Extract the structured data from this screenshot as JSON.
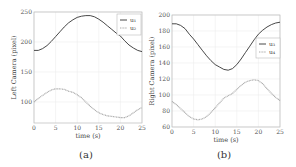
{
  "chart_data": [
    {
      "type": "line",
      "panel_label": "(a)",
      "title": "",
      "xlabel": "time (s)",
      "ylabel": "Left Camera (pixel)",
      "xlim": [
        0,
        25
      ],
      "ylim": [
        65,
        250
      ],
      "xticks": [
        0,
        5,
        10,
        15,
        20,
        25
      ],
      "yticks": [
        100,
        150,
        200,
        250
      ],
      "grid": true,
      "legend_position": "upper right",
      "x": [
        0,
        1,
        2,
        3,
        4,
        5,
        6,
        7,
        8,
        9,
        10,
        11,
        12,
        13,
        14,
        15,
        16,
        17,
        18,
        19,
        20,
        21,
        22,
        23,
        24,
        25
      ],
      "series": [
        {
          "name": "u1",
          "style": "solid",
          "color": "#333333",
          "values": [
            186,
            186,
            189,
            194,
            201,
            209,
            217,
            225,
            232,
            237,
            241,
            243,
            244,
            244,
            242,
            238,
            233,
            227,
            221,
            215,
            210,
            202,
            195,
            190,
            186,
            184
          ]
        },
        {
          "name": "u2",
          "style": "dotted",
          "color": "#aaaaaa",
          "values": [
            100,
            106,
            111,
            116,
            120,
            122,
            122,
            121,
            118,
            116,
            112,
            107,
            100,
            93,
            87,
            82,
            79,
            77,
            76,
            75,
            74,
            74,
            77,
            82,
            87,
            91
          ]
        }
      ]
    },
    {
      "type": "line",
      "panel_label": "(b)",
      "title": "",
      "xlabel": "time (s)",
      "ylabel": "Right Camera (pixel)",
      "xlim": [
        0,
        25
      ],
      "ylim": [
        60,
        200
      ],
      "xticks": [
        0,
        5,
        10,
        15,
        20,
        25
      ],
      "yticks": [
        60,
        80,
        100,
        120,
        140,
        160,
        180,
        200
      ],
      "grid": true,
      "legend_position": "center right",
      "x": [
        0,
        1,
        2,
        3,
        4,
        5,
        6,
        7,
        8,
        9,
        10,
        11,
        12,
        13,
        14,
        15,
        16,
        17,
        18,
        19,
        20,
        21,
        22,
        23,
        24,
        25
      ],
      "series": [
        {
          "name": "u3",
          "style": "solid",
          "color": "#333333",
          "values": [
            189,
            189,
            187,
            183,
            176,
            170,
            163,
            156,
            149,
            143,
            138,
            135,
            132,
            131,
            133,
            138,
            145,
            153,
            161,
            169,
            176,
            181,
            185,
            188,
            190,
            191
          ]
        },
        {
          "name": "u4",
          "style": "dotted",
          "color": "#aaaaaa",
          "values": [
            92,
            88,
            83,
            78,
            73,
            70,
            69,
            70,
            73,
            78,
            84,
            90,
            96,
            99,
            102,
            107,
            112,
            116,
            118,
            119,
            118,
            114,
            108,
            102,
            97,
            93
          ]
        }
      ]
    }
  ],
  "panels": {
    "a": {
      "caption": "(a)",
      "ylabel": "Left Camera (pixel)",
      "xlabel": "time (s)",
      "legend": [
        "u₁",
        "u₂"
      ]
    },
    "b": {
      "caption": "(b)",
      "ylabel": "Right Camera (pixel)",
      "xlabel": "time (s)",
      "legend": [
        "u₃",
        "u₄"
      ]
    }
  }
}
